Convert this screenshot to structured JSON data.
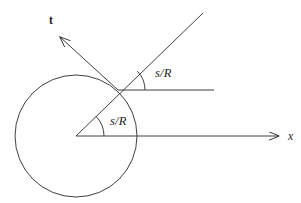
{
  "figure": {
    "name": "rolling-circle-arc-angle-diagram",
    "background_color": "#ffffff",
    "stroke_color": "#2b2b2b",
    "stroke_width": 0.9,
    "width": 301,
    "height": 203
  },
  "labels": {
    "angle_upper": "s/R",
    "angle_lower": "s/R",
    "axis_x": "x",
    "axis_t": "t"
  },
  "geometry": {
    "circle": {
      "cx": 76,
      "cy": 136,
      "r": 61
    },
    "center_point": {
      "x": 76,
      "y": 136
    },
    "tangent_point": {
      "x": 118,
      "y": 90
    },
    "x_axis": {
      "x1": 76,
      "y1": 136,
      "x2": 285,
      "y2": 136
    },
    "x_axis_arrow_tip": {
      "x": 285,
      "y": 136
    },
    "radial_ray": {
      "x1": 76,
      "y1": 136,
      "x2": 203,
      "y2": 13
    },
    "t_axis_arrow": {
      "x1": 118,
      "y1": 90,
      "x2": 55,
      "y2": 32
    },
    "tangent_horizontal": {
      "x1": 118,
      "y1": 90,
      "x2": 214,
      "y2": 90
    },
    "arc_lower": {
      "cx": 76,
      "cy": 136,
      "r": 28,
      "start_deg": 0,
      "end_deg": 44
    },
    "arc_upper": {
      "cx": 118,
      "cy": 90,
      "r": 27,
      "start_deg": 0,
      "end_deg": 44
    }
  }
}
